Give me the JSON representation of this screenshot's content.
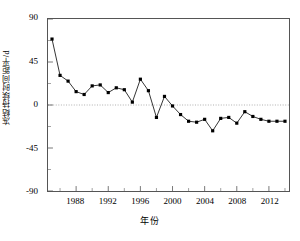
{
  "chart_data": {
    "type": "line",
    "title": "",
    "xlabel": "年份",
    "ylabel": "冻结持续时间距平/d",
    "xlim": [
      1984.5,
      2014.5
    ],
    "ylim": [
      -90,
      90
    ],
    "grid": false,
    "legend": null,
    "marker": "filled-square",
    "line_color": "#000000",
    "marker_color": "#000000",
    "zero_line": {
      "value": 0,
      "style": "dotted",
      "color": "#999999"
    },
    "y_ticks": [
      90,
      45,
      0,
      -45,
      -90
    ],
    "y_tick_labels": [
      "90",
      "45",
      "0",
      "-45",
      "-90"
    ],
    "x_ticks": [
      1988,
      1992,
      1996,
      2000,
      2004,
      2008,
      2012
    ],
    "x_tick_labels": [
      "1988",
      "1992",
      "1996",
      "2000",
      "2004",
      "2008",
      "2012"
    ],
    "x_minor_ticks": [
      1986,
      1990,
      1994,
      1998,
      2002,
      2006,
      2010,
      2014
    ],
    "x": [
      1985,
      1986,
      1987,
      1988,
      1989,
      1990,
      1991,
      1992,
      1993,
      1994,
      1995,
      1996,
      1997,
      1998,
      1999,
      2000,
      2001,
      2002,
      2003,
      2004,
      2005,
      2006,
      2007,
      2008,
      2009,
      2010,
      2011,
      2012,
      2013,
      2014
    ],
    "values": [
      69,
      31,
      25,
      14,
      11,
      20,
      21,
      13,
      18,
      16,
      3,
      27,
      15,
      -13,
      9,
      -1,
      -10,
      -17,
      -18,
      -15,
      -27,
      -14,
      -13,
      -19,
      -7,
      -12,
      -15,
      -17,
      -17,
      -17
    ],
    "series": [
      {
        "name": "冻结持续时间距平",
        "values": [
          69,
          31,
          25,
          14,
          11,
          20,
          21,
          13,
          18,
          16,
          3,
          27,
          15,
          -13,
          9,
          -1,
          -10,
          -17,
          -18,
          -15,
          -27,
          -14,
          -13,
          -19,
          -7,
          -12,
          -15,
          -17,
          -17,
          -17
        ]
      }
    ]
  }
}
